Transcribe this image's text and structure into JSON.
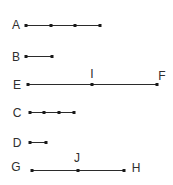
{
  "diagram": {
    "line_color": "#2b2b2b",
    "point_color": "#1a1a1a",
    "text_color": "#2e2e2e",
    "segments": [
      {
        "name": "A",
        "label": "A",
        "label_pos": [
          16,
          25
        ],
        "y": 25,
        "points_x": [
          26,
          51,
          75,
          100
        ]
      },
      {
        "name": "B",
        "label": "B",
        "label_pos": [
          16,
          57
        ],
        "y": 56,
        "points_x": [
          26,
          52
        ]
      },
      {
        "name": "EF",
        "label": "E",
        "label_pos": [
          17,
          85
        ],
        "y": 84,
        "points_x": [
          28,
          92,
          157
        ]
      },
      {
        "name": "C",
        "label": "C",
        "label_pos": [
          17,
          113
        ],
        "y": 112,
        "points_x": [
          30,
          44,
          59,
          74
        ]
      },
      {
        "name": "D",
        "label": "D",
        "label_pos": [
          17,
          143
        ],
        "y": 142,
        "points_x": [
          30,
          46
        ]
      },
      {
        "name": "GH",
        "label": "G",
        "label_pos": [
          16,
          167
        ],
        "y": 170,
        "points_x": [
          32,
          78,
          124
        ]
      }
    ],
    "point_labels": [
      {
        "label": "I",
        "pos": [
          92,
          74
        ]
      },
      {
        "label": "F",
        "pos": [
          162,
          76
        ]
      },
      {
        "label": "J",
        "pos": [
          77,
          158
        ]
      },
      {
        "label": "H",
        "pos": [
          136,
          168
        ]
      }
    ]
  }
}
